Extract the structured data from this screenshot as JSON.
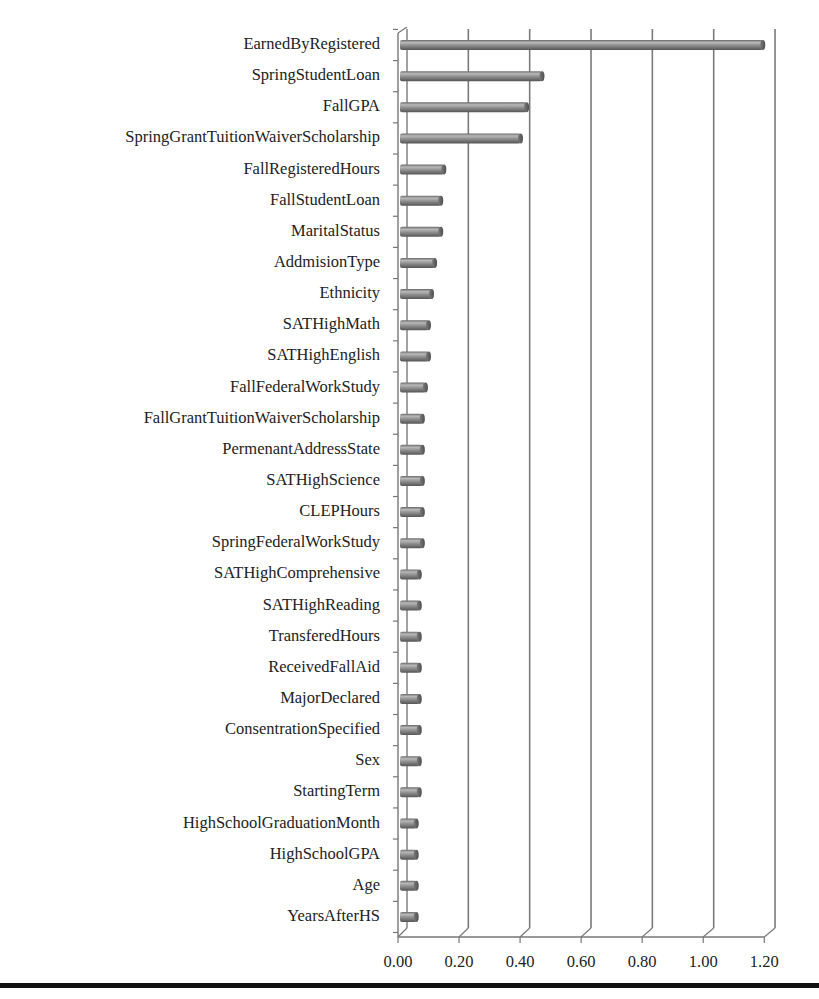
{
  "chart_data": {
    "type": "bar",
    "orientation": "horizontal",
    "style": "3d-cylinder",
    "title": "",
    "xlabel": "",
    "ylabel": "",
    "xlim": [
      0,
      1.2
    ],
    "x_ticks": [
      "0.00",
      "0.20",
      "0.40",
      "0.60",
      "0.80",
      "1.00",
      "1.20"
    ],
    "grid": {
      "vertical": true,
      "horizontal": false
    },
    "legend": null,
    "categories": [
      "EarnedByRegistered",
      "SpringStudentLoan",
      "FallGPA",
      "SpringGrantTuitionWaiverScholarship",
      "FallRegisteredHours",
      "FallStudentLoan",
      "MaritalStatus",
      "AddmisionType",
      "Ethnicity",
      "SATHighMath",
      "SATHighEnglish",
      "FallFederalWorkStudy",
      "FallGrantTuitionWaiverScholarship",
      "PermenantAddressState",
      "SATHighScience",
      "CLEPHours",
      "SpringFederalWorkStudy",
      "SATHighComprehensive",
      "SATHighReading",
      "TransferedHours",
      "ReceivedFallAid",
      "MajorDeclared",
      "ConsentrationSpecified",
      "Sex",
      "StartingTerm",
      "HighSchoolGraduationMonth",
      "HighSchoolGPA",
      "Age",
      "YearsAfterHS"
    ],
    "values": [
      1.16,
      0.44,
      0.39,
      0.37,
      0.12,
      0.11,
      0.11,
      0.09,
      0.08,
      0.07,
      0.07,
      0.06,
      0.05,
      0.05,
      0.05,
      0.05,
      0.05,
      0.04,
      0.04,
      0.04,
      0.04,
      0.04,
      0.04,
      0.04,
      0.04,
      0.03,
      0.03,
      0.03,
      0.03
    ]
  },
  "colors": {
    "bar_fill": "#8a8a8a",
    "bar_highlight": "#b4b4b4",
    "bar_shadow": "#5e5e5e",
    "gridline": "#7a7a7a",
    "axis": "#777777",
    "text": "#222222",
    "rule": "#111111"
  }
}
